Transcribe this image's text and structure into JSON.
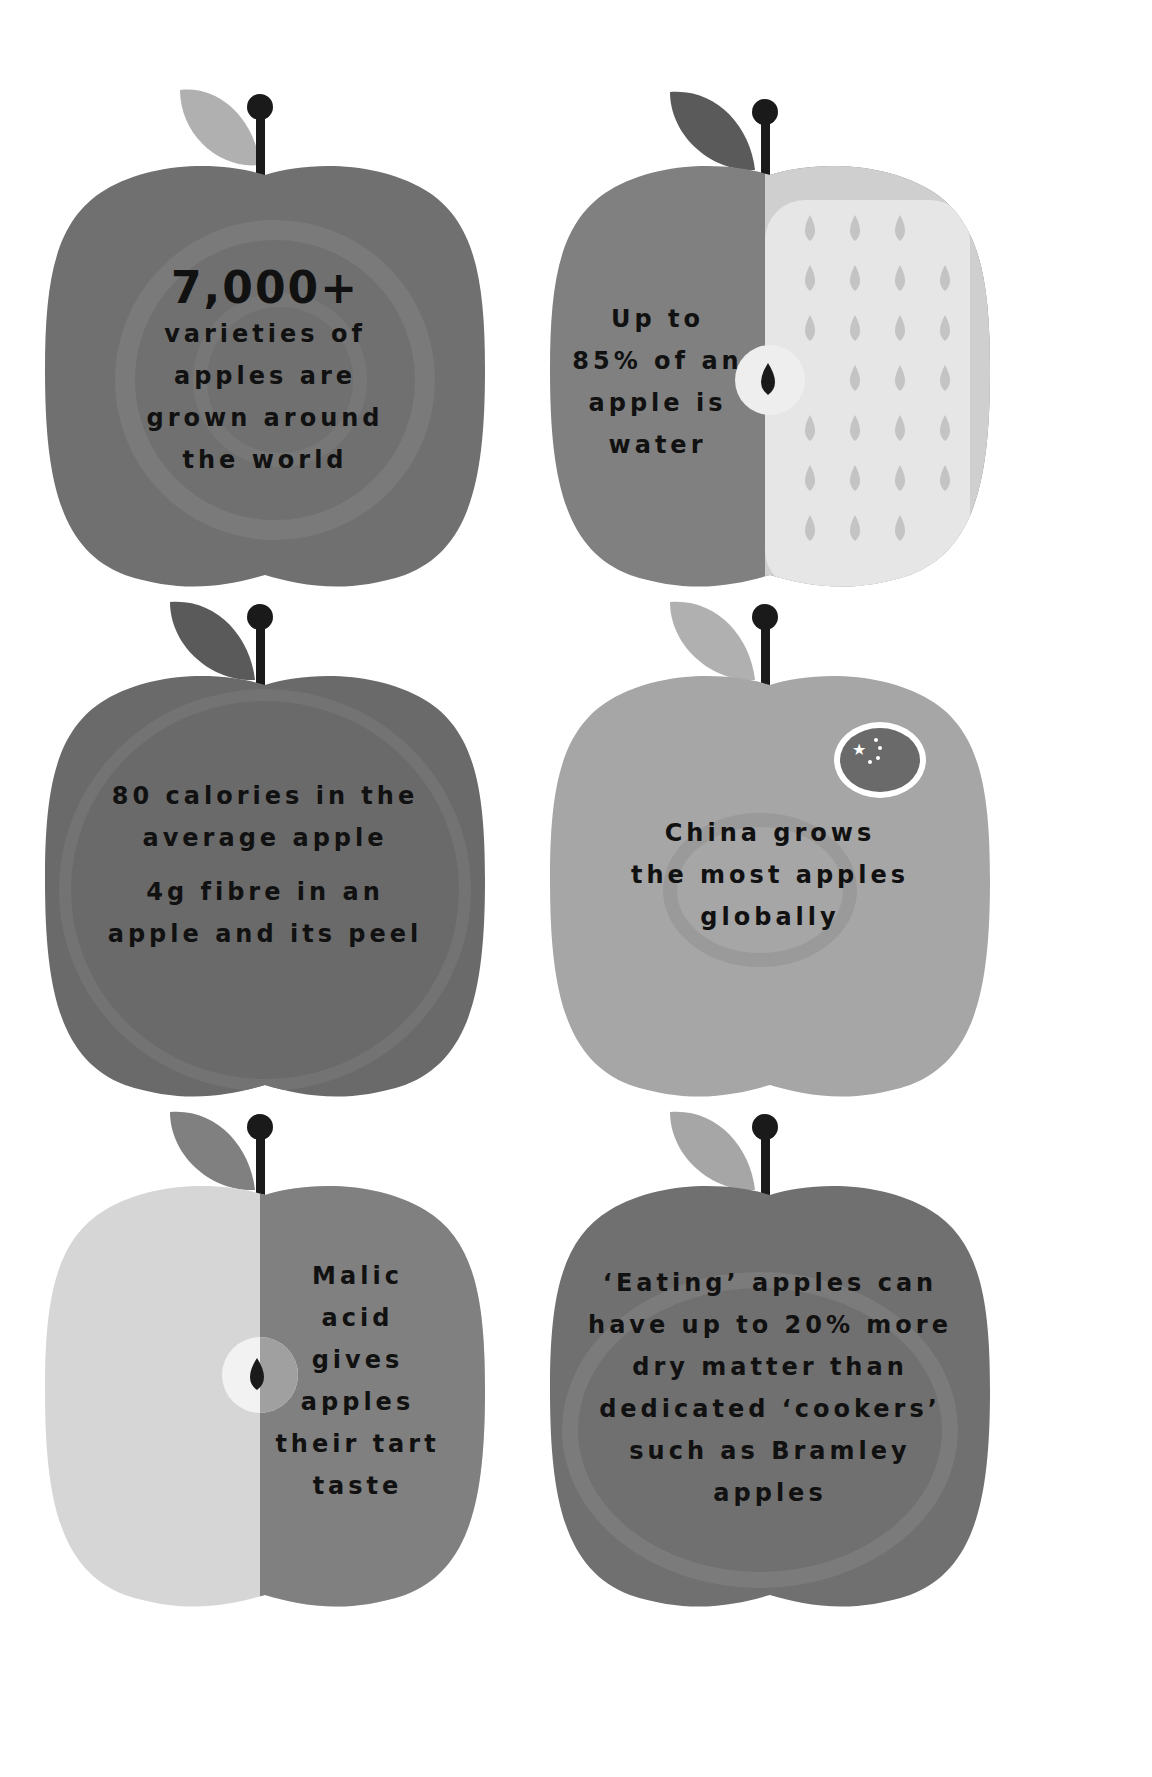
{
  "infographic": {
    "colors": {
      "background": "#ffffff",
      "apple_dark": "#707070",
      "apple_mid": "#808080",
      "apple_light": "#a6a6a6",
      "apple_pale": "#d6d6d6",
      "leaf_light": "#b0b0b0",
      "leaf_dark": "#5a5a5a",
      "stem": "#1a1a1a",
      "text": "#111111"
    },
    "apples": [
      {
        "id": "varieties",
        "headline": "7,000+",
        "lines": [
          "varieties of",
          "apples are",
          "grown around",
          "the world"
        ]
      },
      {
        "id": "water",
        "lines": [
          "Up to",
          "85% of an",
          "apple is",
          "water"
        ]
      },
      {
        "id": "calories-fibre",
        "lines": [
          "80 calories in the",
          "average apple"
        ],
        "lines2": [
          "4g fibre in an",
          "apple and its peel"
        ]
      },
      {
        "id": "china",
        "lines": [
          "China grows",
          "the most apples",
          "globally"
        ],
        "badge_icon": "china-flag-icon"
      },
      {
        "id": "malic-acid",
        "lines": [
          "Malic",
          "acid",
          "gives",
          "apples",
          "their tart",
          "taste"
        ]
      },
      {
        "id": "dry-matter",
        "lines": [
          "‘Eating’ apples can",
          "have up to 20% more",
          "dry matter than",
          "dedicated ‘cookers’",
          "such as Bramley",
          "apples"
        ]
      }
    ]
  }
}
